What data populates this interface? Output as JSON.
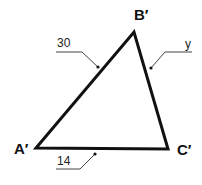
{
  "diagram": {
    "vertices": {
      "A": {
        "label": "A′",
        "x": 36,
        "y": 148
      },
      "B": {
        "label": "B′",
        "x": 134,
        "y": 32
      },
      "C": {
        "label": "C′",
        "x": 168,
        "y": 149
      }
    },
    "sides": {
      "AB": {
        "label": "30"
      },
      "BC": {
        "label": "y"
      },
      "AC": {
        "label": "14"
      }
    },
    "colors": {
      "stroke": "#111111",
      "leader": "#444444"
    }
  }
}
